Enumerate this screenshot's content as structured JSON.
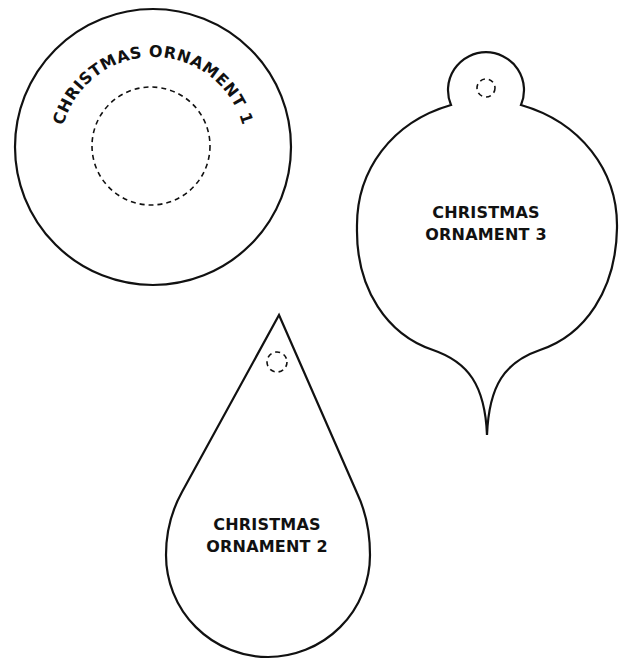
{
  "page": {
    "background": "#ffffff",
    "stroke_color": "#111111"
  },
  "ornaments": [
    {
      "id": "ornament-1",
      "shape": "circle",
      "label": "CHRISTMAS ORNAMENT 1",
      "label_style": "curved along top arc",
      "has_dashed_inner_circle": true
    },
    {
      "id": "ornament-2",
      "shape": "teardrop",
      "label_line1": "CHRISTMAS",
      "label_line2": "ORNAMENT 2",
      "has_dashed_hang_hole": true
    },
    {
      "id": "ornament-3",
      "shape": "bulb with cap and pointed bottom",
      "label_line1": "CHRISTMAS",
      "label_line2": "ORNAMENT 3",
      "has_dashed_hang_hole": true
    }
  ]
}
